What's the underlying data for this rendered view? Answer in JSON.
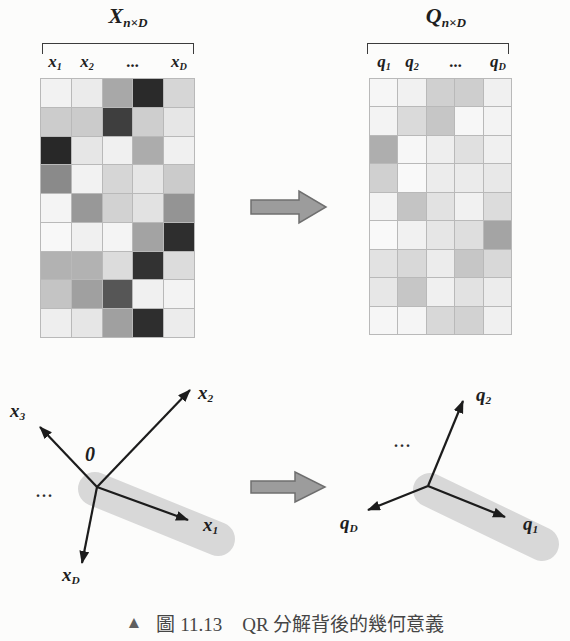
{
  "matrices": {
    "left": {
      "title_base": "X",
      "title_sub": "n×D",
      "col_labels": [
        {
          "base": "x",
          "sub": "1"
        },
        {
          "base": "x",
          "sub": "2"
        },
        {
          "base": "...",
          "sub": ""
        },
        {
          "base": "x",
          "sub": "D"
        }
      ],
      "rows": 9,
      "cols": 5,
      "cells": [
        [
          242,
          235,
          168,
          42,
          214
        ],
        [
          204,
          203,
          62,
          206,
          230
        ],
        [
          40,
          230,
          240,
          172,
          240
        ],
        [
          138,
          242,
          214,
          230,
          203
        ],
        [
          244,
          152,
          210,
          226,
          148
        ],
        [
          248,
          240,
          244,
          163,
          46
        ],
        [
          178,
          178,
          220,
          50,
          220
        ],
        [
          196,
          160,
          86,
          240,
          243
        ],
        [
          238,
          230,
          160,
          46,
          236
        ]
      ]
    },
    "right": {
      "title_base": "Q",
      "title_sub": "n×D",
      "col_labels": [
        {
          "base": "q",
          "sub": "1"
        },
        {
          "base": "q",
          "sub": "2"
        },
        {
          "base": "...",
          "sub": ""
        },
        {
          "base": "q",
          "sub": "D"
        }
      ],
      "rows": 9,
      "cols": 5,
      "cells": [
        [
          246,
          241,
          208,
          206,
          240
        ],
        [
          243,
          218,
          198,
          247,
          243
        ],
        [
          174,
          247,
          238,
          224,
          240
        ],
        [
          208,
          249,
          236,
          235,
          232
        ],
        [
          243,
          196,
          226,
          241,
          220
        ],
        [
          249,
          241,
          230,
          222,
          164
        ],
        [
          226,
          216,
          236,
          198,
          216
        ],
        [
          231,
          198,
          240,
          226,
          236
        ],
        [
          246,
          245,
          216,
          210,
          240
        ]
      ]
    }
  },
  "vector_diagrams": {
    "left": {
      "origin_label": "0",
      "ellipsis": "...",
      "labels": {
        "x2": {
          "base": "x",
          "sub": "2"
        },
        "x3": {
          "base": "x",
          "sub": "3"
        },
        "x1": {
          "base": "x",
          "sub": "1"
        },
        "xD": {
          "base": "x",
          "sub": "D"
        }
      }
    },
    "right": {
      "ellipsis": "...",
      "labels": {
        "q2": {
          "base": "q",
          "sub": "2"
        },
        "q1": {
          "base": "q",
          "sub": "1"
        },
        "qD": {
          "base": "q",
          "sub": "D"
        }
      }
    }
  },
  "caption": {
    "marker": "▲",
    "figure_label": "圖 11.13",
    "text": "QR 分解背後的幾何意義"
  },
  "colors": {
    "grid_line": "#b9b9b9",
    "capsule": "#d8d8d8",
    "vector": "#1c1c1c",
    "blockarrow_fill": "#9c9c9c",
    "blockarrow_stroke": "#6f6f6f",
    "caption_text": "#454545",
    "ink": "#1e1e1e",
    "bg": "#fcfcfb"
  }
}
